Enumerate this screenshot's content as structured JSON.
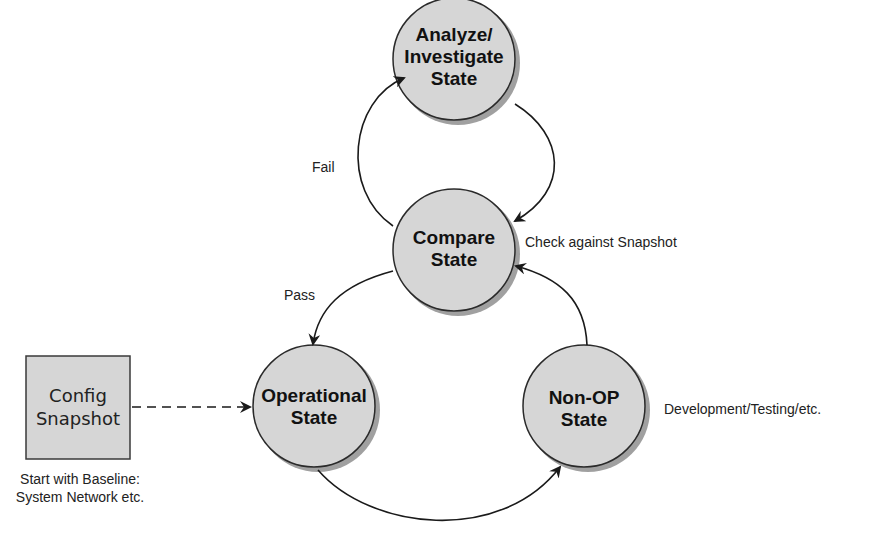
{
  "diagram": {
    "type": "state-transition",
    "states": [
      {
        "id": "analyze",
        "label_line1": "Analyze/",
        "label_line2": "Investigate",
        "label_line3": "State"
      },
      {
        "id": "compare",
        "label_line1": "Compare",
        "label_line2": "State"
      },
      {
        "id": "operational",
        "label_line1": "Operational",
        "label_line2": "State"
      },
      {
        "id": "nonop",
        "label_line1": "Non-OP",
        "label_line2": "State"
      }
    ],
    "snapshot_box": {
      "label_line1": "Config",
      "label_line2": "Snapshot"
    },
    "edges": [
      {
        "from": "compare",
        "to": "analyze",
        "label": "Fail"
      },
      {
        "from": "analyze",
        "to": "compare",
        "label": ""
      },
      {
        "from": "compare",
        "to": "operational",
        "label": "Pass"
      },
      {
        "from": "operational",
        "to": "nonop",
        "label": ""
      },
      {
        "from": "nonop",
        "to": "compare",
        "label": ""
      },
      {
        "from": "snapshot_box",
        "to": "operational",
        "label": "",
        "style": "dashed"
      }
    ],
    "annotations": {
      "check": "Check against Snapshot",
      "nonop_note": "Development/Testing/etc.",
      "baseline_line1": "Start with Baseline:",
      "baseline_line2": "System Network etc."
    },
    "colors": {
      "fill": "#d6d6d6",
      "stroke": "#2a2a2a",
      "shadow": "#777777"
    }
  }
}
